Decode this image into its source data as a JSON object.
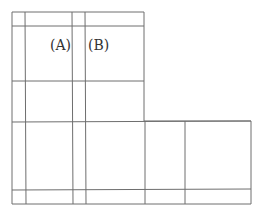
{
  "diagram": {
    "line_color": "#6e6e6e",
    "label_color": "#333333",
    "labels": [
      {
        "id": "A",
        "text": "(A)",
        "x": 50,
        "y": 50
      },
      {
        "id": "B",
        "text": "(B)",
        "x": 88,
        "y": 50
      }
    ],
    "outline": {
      "points": "12,12 144,12 144,121 251,121 251,204 12,204"
    },
    "lines": [
      {
        "x1": 12,
        "y1": 26,
        "x2": 144,
        "y2": 26
      },
      {
        "x1": 12,
        "y1": 81,
        "x2": 144,
        "y2": 81
      },
      {
        "x1": 12,
        "y1": 122,
        "x2": 251,
        "y2": 121
      },
      {
        "x1": 12,
        "y1": 190,
        "x2": 251,
        "y2": 189
      },
      {
        "x1": 25,
        "y1": 12,
        "x2": 26,
        "y2": 204
      },
      {
        "x1": 72,
        "y1": 12,
        "x2": 73,
        "y2": 204
      },
      {
        "x1": 85,
        "y1": 12,
        "x2": 86,
        "y2": 204
      },
      {
        "x1": 145,
        "y1": 121,
        "x2": 145,
        "y2": 204
      },
      {
        "x1": 185,
        "y1": 121,
        "x2": 185,
        "y2": 204
      }
    ]
  }
}
